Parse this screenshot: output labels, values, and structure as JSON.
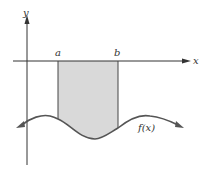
{
  "diagram": {
    "type": "definite-integral-negative-region",
    "axes": {
      "x_label": "x",
      "y_label": "y"
    },
    "bounds": {
      "lower_label": "a",
      "upper_label": "b"
    },
    "function_label": "f(x)",
    "colors": {
      "axis": "#333333",
      "curve": "#555555",
      "shaded_region": "#d9d9d9"
    }
  }
}
